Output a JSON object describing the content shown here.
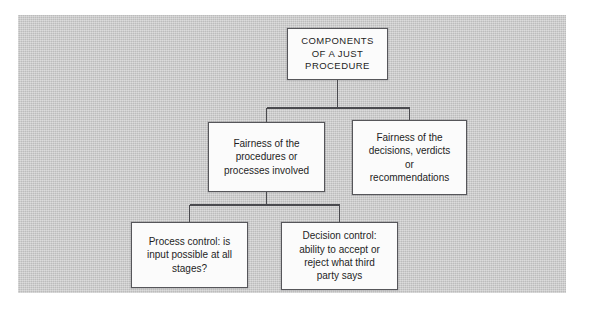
{
  "diagram": {
    "type": "hierarchy-tree",
    "title": "Components of a Just Procedure",
    "panel_color": "#c9c9c9",
    "box_fill_color": "#fbfbfb",
    "box_border_color": "#56565a",
    "line_color": "#4a4a4e",
    "text_color": "#1e1e1e",
    "nodes": {
      "root": {
        "id": "root",
        "label": "COMPONENTS\nOF A JUST\nPROCEDURE",
        "level": 0
      },
      "procedures": {
        "id": "procedures",
        "label": "Fairness of the\nprocedures or\nprocesses involved",
        "level": 1
      },
      "decisions": {
        "id": "decisions",
        "label": "Fairness of the\ndecisions, verdicts\nor\nrecommendations",
        "level": 1
      },
      "process_control": {
        "id": "process_control",
        "label": "Process control: is\ninput possible at all\nstages?",
        "level": 2
      },
      "decision_control": {
        "id": "decision_control",
        "label": "Decision control:\nability to accept or\nreject what third\nparty says",
        "level": 2
      }
    },
    "edges": [
      {
        "from": "root",
        "to": "procedures"
      },
      {
        "from": "root",
        "to": "decisions"
      },
      {
        "from": "procedures",
        "to": "process_control"
      },
      {
        "from": "procedures",
        "to": "decision_control"
      }
    ]
  }
}
